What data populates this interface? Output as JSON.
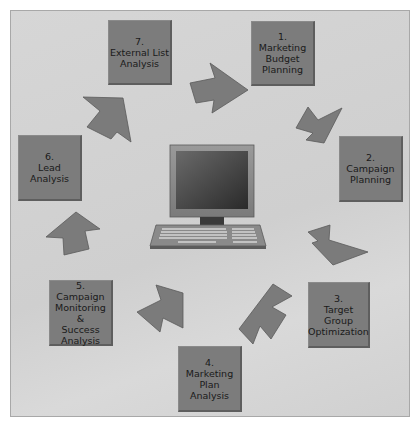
{
  "diagram": {
    "type": "cycle",
    "center": {
      "icon": "computer-icon"
    },
    "steps": [
      {
        "number": "1.",
        "label": "Marketing\nBudget\nPlanning"
      },
      {
        "number": "2.",
        "label": "Campaign\nPlanning"
      },
      {
        "number": "3.",
        "label": "Target\nGroup\nOptimization"
      },
      {
        "number": "4.",
        "label": "Marketing\nPlan\nAnalysis"
      },
      {
        "number": "5.",
        "label": "Campaign\nMonitoring &\nSuccess\nAnalysis"
      },
      {
        "number": "6.",
        "label": "Lead\nAnalysis"
      },
      {
        "number": "7.",
        "label": "External List\nAnalysis"
      }
    ],
    "colors": {
      "box": "#7c7c7c",
      "arrow": "#7a7a7a",
      "background": "#d3d3d3"
    }
  }
}
